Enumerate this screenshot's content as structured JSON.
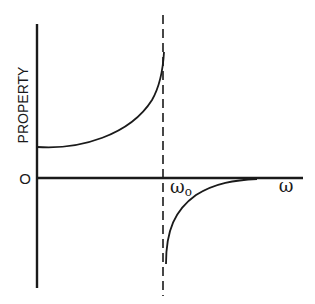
{
  "figure": {
    "type": "dispersion-schematic",
    "y_axis_label": "PROPERTY",
    "origin_label": "O",
    "x_axis_label": "ω",
    "resonance_label": "ω",
    "resonance_subscript": "o",
    "colors": {
      "ink": "#1a1a1a",
      "background": "#ffffff"
    },
    "curves": [
      {
        "name": "below-resonance",
        "description": "positive branch rising from a constant level toward +infinity as ω approaches ω0"
      },
      {
        "name": "above-resonance",
        "description": "negative branch rising from -infinity toward zero as ω increases past ω0"
      }
    ],
    "asymptote": {
      "style": "dashed",
      "position": "ω0"
    }
  }
}
